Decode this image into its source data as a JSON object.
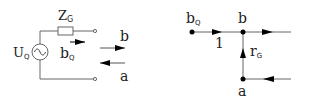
{
  "circuit": {
    "impedance_label": "Z",
    "impedance_sub": "G",
    "source_label": "U",
    "source_sub": "Q",
    "source_symbol": "~",
    "source_wave_label": "b",
    "source_wave_sub": "Q",
    "outgoing_wave_label": "b",
    "incoming_wave_label": "a"
  },
  "signal_flow_graph": {
    "nodes": [
      {
        "id": "bQ",
        "label": "b",
        "sub": "Q"
      },
      {
        "id": "b",
        "label": "b",
        "sub": ""
      },
      {
        "id": "a",
        "label": "a",
        "sub": ""
      }
    ],
    "edges": [
      {
        "from": "bQ",
        "to": "b",
        "label": "1",
        "sub": ""
      },
      {
        "from": "a",
        "to": "b",
        "label": "r",
        "sub": "G"
      }
    ]
  },
  "colors": {
    "line": "#555555",
    "arrow": "#000000",
    "text": "#222222"
  }
}
